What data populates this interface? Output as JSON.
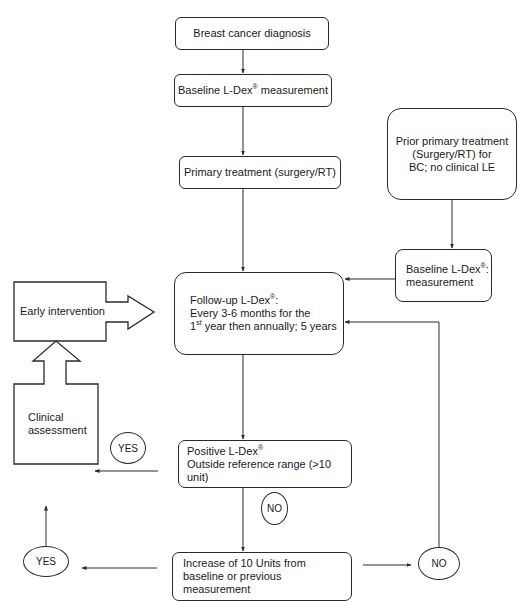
{
  "diagram": {
    "type": "flowchart",
    "nodes": {
      "diagnosis": {
        "text": "Breast cancer diagnosis"
      },
      "baseline": {
        "text_pre": "Baseline L-Dex",
        "sup": "®",
        "text_post": " measurement"
      },
      "primary_treatment": {
        "text": "Primary treatment (surgery/RT)"
      },
      "prior_treatment": {
        "line1": "Prior primary treatment",
        "line2": "(Surgery/RT) for",
        "line3": "BC; no clinical LE"
      },
      "baseline_prior": {
        "line1_pre": "Baseline L-Dex",
        "line1_sup": "®",
        "line1_post": ":",
        "line2": "measurement"
      },
      "follow_up": {
        "line1_pre": "Follow-up L-Dex",
        "line1_sup": "®",
        "line1_post": ":",
        "line2": "Every 3-6 months for the",
        "line3_pre": "1",
        "line3_sup": "st",
        "line3_post": " year then annually; 5 years"
      },
      "positive": {
        "line1_pre": "Positive L-Dex",
        "line1_sup": "®",
        "line2": "Outside reference range (>10 unit)"
      },
      "increase": {
        "line1": "Increase of 10 Units from",
        "line2": "baseline or previous measurement"
      },
      "early_intervention": {
        "text": "Early intervention"
      },
      "clinical_assessment": {
        "line1": "Clinical",
        "line2": "assessment"
      }
    },
    "decisions": {
      "yes_positive": "YES",
      "no_positive": "NO",
      "yes_increase": "YES",
      "no_increase": "NO"
    },
    "edges": [
      {
        "from": "diagnosis",
        "to": "baseline"
      },
      {
        "from": "baseline",
        "to": "primary_treatment"
      },
      {
        "from": "primary_treatment",
        "to": "follow_up"
      },
      {
        "from": "prior_treatment",
        "to": "baseline_prior"
      },
      {
        "from": "baseline_prior",
        "to": "follow_up"
      },
      {
        "from": "follow_up",
        "to": "positive"
      },
      {
        "from": "positive",
        "to": "clinical_assessment",
        "label": "YES"
      },
      {
        "from": "positive",
        "to": "increase",
        "label": "NO"
      },
      {
        "from": "increase",
        "to": "clinical_assessment",
        "label": "YES"
      },
      {
        "from": "increase",
        "to": "follow_up",
        "label": "NO"
      },
      {
        "from": "clinical_assessment",
        "to": "early_intervention"
      },
      {
        "from": "early_intervention",
        "to": "follow_up"
      }
    ],
    "colors": {
      "stroke": "#2a2a2a",
      "background": "#ffffff",
      "text": "#1a1a1a"
    }
  }
}
